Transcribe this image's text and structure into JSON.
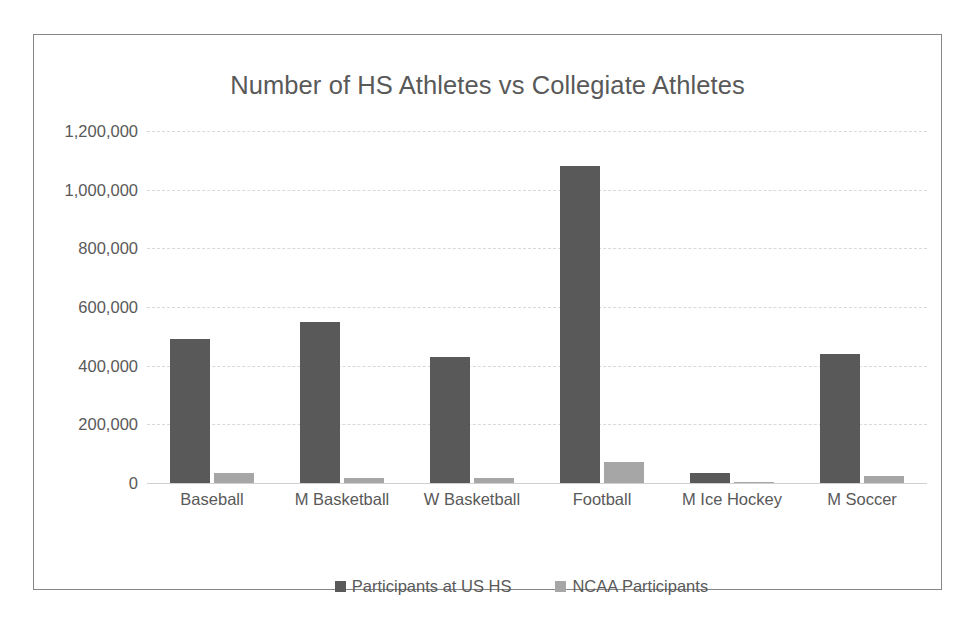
{
  "chart_data": {
    "type": "bar",
    "title": "Number of HS Athletes vs Collegiate Athletes",
    "xlabel": "",
    "ylabel": "",
    "ylim": [
      0,
      1200000
    ],
    "y_ticks": [
      0,
      200000,
      400000,
      600000,
      800000,
      1000000,
      1200000
    ],
    "y_tick_labels": [
      "0",
      "200,000",
      "400,000",
      "600,000",
      "800,000",
      "1,000,000",
      "1,200,000"
    ],
    "grid": true,
    "legend_position": "bottom",
    "categories": [
      "Baseball",
      "M Basketball",
      "W Basketball",
      "Football",
      "M Ice Hockey",
      "M Soccer"
    ],
    "series": [
      {
        "name": "Participants at US HS",
        "color": "#595959",
        "values": [
          490000,
          550000,
          430000,
          1080000,
          35000,
          440000
        ]
      },
      {
        "name": "NCAA Participants",
        "color": "#a6a6a6",
        "values": [
          33000,
          18000,
          16000,
          70000,
          4000,
          24000
        ]
      }
    ]
  },
  "style": {
    "text_color": "#595959",
    "frame_color": "#868686",
    "gridline_color": "#d9d9d9",
    "background": "#ffffff"
  }
}
